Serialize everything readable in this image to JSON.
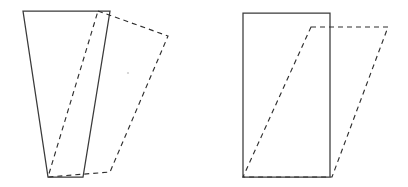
{
  "figure": {
    "canvas": {
      "width": 408,
      "height": 187,
      "background": "#ffffff"
    },
    "style": {
      "solid_stroke_color": "#3a3a3a",
      "dashed_stroke_color": "#2f2f2f",
      "solid_stroke_width": 1.25,
      "dashed_stroke_width": 1.15,
      "dash_pattern": "5 4"
    },
    "panels": [
      {
        "id": "left-panel",
        "name": "tapered-shape-shear-comparison",
        "shapes": [
          {
            "id": "left-solid-trapezoid",
            "name": "solid-trapezoid",
            "line_style": "solid",
            "closed": true,
            "points": [
              [
                23,
                11
              ],
              [
                110,
                11
              ],
              [
                83,
                177
              ],
              [
                48,
                177
              ]
            ]
          },
          {
            "id": "left-dashed-trapezoid",
            "name": "dashed-sheared-trapezoid",
            "line_style": "dashed",
            "closed": true,
            "points": [
              [
                98,
                11
              ],
              [
                168,
                36
              ],
              [
                110,
                172
              ],
              [
                48,
                177
              ]
            ]
          }
        ]
      },
      {
        "id": "right-panel",
        "name": "rectangle-shear-comparison",
        "shapes": [
          {
            "id": "right-solid-rectangle",
            "name": "solid-rectangle",
            "line_style": "solid",
            "closed": true,
            "points": [
              [
                243,
                13
              ],
              [
                330,
                13
              ],
              [
                330,
                177
              ],
              [
                243,
                177
              ]
            ]
          },
          {
            "id": "right-dashed-parallelogram",
            "name": "dashed-sheared-parallelogram",
            "line_style": "dashed",
            "closed": true,
            "points": [
              [
                311,
                27
              ],
              [
                388,
                27
              ],
              [
                332,
                177
              ],
              [
                243,
                177
              ]
            ]
          }
        ]
      }
    ],
    "specks": [
      {
        "cx": 128,
        "cy": 73,
        "r": 1.1
      },
      {
        "cx": 24,
        "cy": 9,
        "r": 0.8
      }
    ]
  }
}
